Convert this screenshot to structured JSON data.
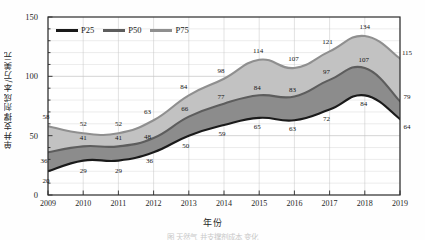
{
  "chart_data": {
    "type": "area",
    "title": "",
    "xlabel": "年份",
    "ylabel": "单井支撑剂成本/万美元",
    "x": [
      2009,
      2010,
      2011,
      2012,
      2013,
      2014,
      2015,
      2016,
      2017,
      2018,
      2019
    ],
    "categories": [
      "2009",
      "2010",
      "2011",
      "2012",
      "2013",
      "2014",
      "2015",
      "2016",
      "2017",
      "2018",
      "2019"
    ],
    "series": [
      {
        "name": "P25",
        "color": "#1a1a1a",
        "values": [
          20,
          29,
          29,
          36,
          50,
          59,
          65,
          63,
          72,
          84,
          64
        ]
      },
      {
        "name": "P50",
        "color": "#5d5d5d",
        "values": [
          36,
          41,
          41,
          48,
          66,
          77,
          84,
          83,
          97,
          107,
          79
        ]
      },
      {
        "name": "P75",
        "color": "#8f8f8f",
        "values": [
          58,
          52,
          52,
          63,
          84,
          98,
          114,
          107,
          121,
          134,
          115
        ]
      }
    ],
    "bands": [
      {
        "name": "P25-P50",
        "fill": "#8c8c8c"
      },
      {
        "name": "P50-P75",
        "fill": "#c2c2c2"
      }
    ],
    "ylim": [
      0,
      150
    ],
    "yticks": [
      0,
      50,
      100,
      150
    ],
    "yticks_minor_step": 10,
    "xlim": [
      2009,
      2019
    ],
    "grid": true,
    "legend_position": "top-left-inside"
  },
  "legend": {
    "items": [
      {
        "label": "P25",
        "color": "#1a1a1a"
      },
      {
        "label": "P50",
        "color": "#5d5d5d"
      },
      {
        "label": "P75",
        "color": "#8f8f8f"
      }
    ]
  },
  "caption_remnant": "图    天然气   井支撑剂成本     变化"
}
